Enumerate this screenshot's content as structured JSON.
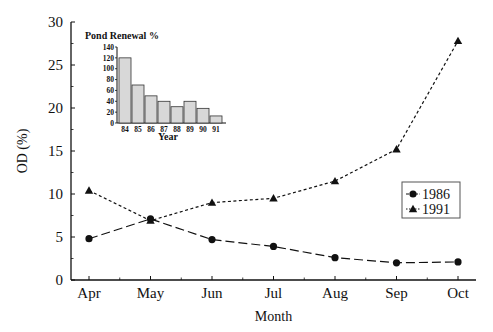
{
  "chart_data": [
    {
      "type": "line",
      "title": "",
      "xlabel": "Month",
      "ylabel": "OD (%)",
      "categories": [
        "Apr",
        "May",
        "Jun",
        "Jul",
        "Aug",
        "Sep",
        "Oct"
      ],
      "ylim": [
        0,
        30
      ],
      "yticks": [
        0,
        5,
        10,
        15,
        20,
        25,
        30
      ],
      "grid": false,
      "legend_position": "right-middle",
      "series": [
        {
          "name": "1986",
          "marker": "circle",
          "line_style": "long-dash",
          "values": [
            4.8,
            7.1,
            4.7,
            3.9,
            2.6,
            2.0,
            2.1
          ]
        },
        {
          "name": "1991",
          "marker": "triangle",
          "line_style": "dotted",
          "values": [
            10.4,
            6.9,
            9.0,
            9.5,
            11.5,
            15.2,
            27.8
          ]
        }
      ]
    },
    {
      "type": "bar",
      "title": "Pond Renewal %",
      "xlabel": "Year",
      "ylabel": "",
      "categories": [
        "84",
        "85",
        "86",
        "87",
        "88",
        "89",
        "90",
        "91"
      ],
      "values": [
        120,
        70,
        50,
        40,
        30,
        40,
        27,
        13
      ],
      "ylim": [
        0,
        140
      ],
      "yticks": [
        0,
        20,
        40,
        60,
        80,
        100,
        120,
        140
      ],
      "grid": false,
      "position": "inset-top-left"
    }
  ],
  "colors": {
    "ink": "#111111",
    "bar_fill": "#d8d8d8",
    "background": "#ffffff"
  }
}
